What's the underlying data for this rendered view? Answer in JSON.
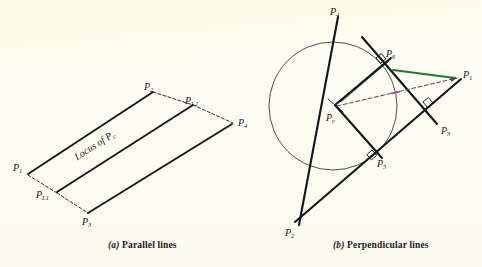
{
  "figure": {
    "background_color": "#fdfdf2",
    "ink_color": "#16161a",
    "accent_green": "#1f7a33",
    "accent_magenta": "#b43cb4",
    "dash_color": "#4a4a52"
  },
  "panel_a": {
    "caption_prefix": "(a)",
    "caption_text": "Parallel lines",
    "locus_label": "Locus of P",
    "locus_sub": "c",
    "points": [
      {
        "id": "p1",
        "label": "P",
        "sub": "1",
        "x": 13,
        "y": 163
      },
      {
        "id": "p2",
        "label": "P",
        "sub": "2",
        "x": 144,
        "y": 82
      },
      {
        "id": "p3",
        "label": "P",
        "sub": "3",
        "x": 82,
        "y": 217
      },
      {
        "id": "p4",
        "label": "P",
        "sub": "4",
        "x": 238,
        "y": 118
      },
      {
        "id": "pl1",
        "label": "P",
        "sub": "L1",
        "x": 36,
        "y": 190
      },
      {
        "id": "pl2",
        "label": "P",
        "sub": "L2",
        "x": 185,
        "y": 96
      }
    ],
    "solid_segments": [
      {
        "name": "segment-p1-p2",
        "x1": 28,
        "y1": 174,
        "x2": 153,
        "y2": 92
      },
      {
        "name": "segment-p3-p4",
        "x1": 88,
        "y1": 213,
        "x2": 232,
        "y2": 124
      },
      {
        "name": "segment-locus",
        "x1": 57,
        "y1": 192,
        "x2": 193,
        "y2": 105
      }
    ],
    "dashed_segments": [
      {
        "name": "dash-p1-pl1",
        "x1": 28,
        "y1": 175,
        "x2": 57,
        "y2": 193
      },
      {
        "name": "dash-pl1-p3",
        "x1": 57,
        "y1": 193,
        "x2": 88,
        "y2": 213
      },
      {
        "name": "dash-p2-pl2",
        "x1": 153,
        "y1": 92,
        "x2": 193,
        "y2": 105
      },
      {
        "name": "dash-pl2-p4",
        "x1": 193,
        "y1": 105,
        "x2": 233,
        "y2": 123
      }
    ]
  },
  "panel_b": {
    "caption_prefix": "(b)",
    "caption_text": "Perpendicular lines",
    "circle": {
      "cx": 333,
      "cy": 106,
      "r": 64
    },
    "points": [
      {
        "id": "p1",
        "label": "P",
        "sub": "1",
        "x": 463,
        "y": 70
      },
      {
        "id": "p2",
        "label": "P",
        "sub": "2",
        "x": 285,
        "y": 228
      },
      {
        "id": "p3",
        "label": "P",
        "sub": "3",
        "x": 441,
        "y": 126
      },
      {
        "id": "p4",
        "label": "P",
        "sub": "4",
        "x": 330,
        "y": 7
      },
      {
        "id": "p5",
        "label": "P",
        "sub": "5",
        "x": 377,
        "y": 159
      },
      {
        "id": "p6",
        "label": "P",
        "sub": "6",
        "x": 386,
        "y": 49
      },
      {
        "id": "pc",
        "label": "P",
        "sub": "c",
        "x": 326,
        "y": 113
      }
    ],
    "solid_lines": [
      {
        "name": "line-p4-p5-p2",
        "x1": 338,
        "y1": 17,
        "x2": 299,
        "y2": 225
      },
      {
        "name": "line-p2-p1",
        "x1": 295,
        "y1": 222,
        "x2": 461,
        "y2": 79
      },
      {
        "name": "line-p6-p3",
        "x1": 362,
        "y1": 37,
        "x2": 437,
        "y2": 124
      },
      {
        "name": "chord-pc-p6",
        "x1": 335,
        "y1": 105,
        "x2": 391,
        "y2": 58
      },
      {
        "name": "chord-pc-p5",
        "x1": 335,
        "y1": 105,
        "x2": 382,
        "y2": 158
      }
    ],
    "green_segments": [
      {
        "name": "green-pc-p6",
        "x1": 341,
        "y1": 101,
        "x2": 388,
        "y2": 61
      },
      {
        "name": "green-p6-p1",
        "x1": 393,
        "y1": 70,
        "x2": 455,
        "y2": 78
      }
    ],
    "dashed_lines": [
      {
        "name": "dash-pc-p1",
        "x1": 337,
        "y1": 106,
        "x2": 457,
        "y2": 78
      }
    ],
    "right_angle_marks": [
      {
        "name": "right-angle-p6",
        "x": 376,
        "y": 58,
        "angle": -40
      },
      {
        "name": "right-angle-p5",
        "x": 372,
        "y": 150,
        "angle": 48
      },
      {
        "name": "right-angle-p3",
        "x": 423,
        "y": 102,
        "angle": -40
      }
    ]
  }
}
